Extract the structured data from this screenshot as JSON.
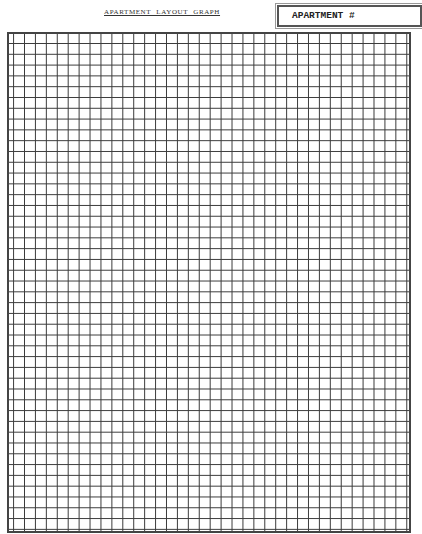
{
  "header": {
    "title": "APARTMENT LAYOUT GRAPH",
    "apartment_label": "APARTMENT #",
    "apartment_value": ""
  },
  "grid": {
    "columns": 37,
    "rows": 46,
    "line_color": "#3a3a3a",
    "border_color": "#444444"
  }
}
